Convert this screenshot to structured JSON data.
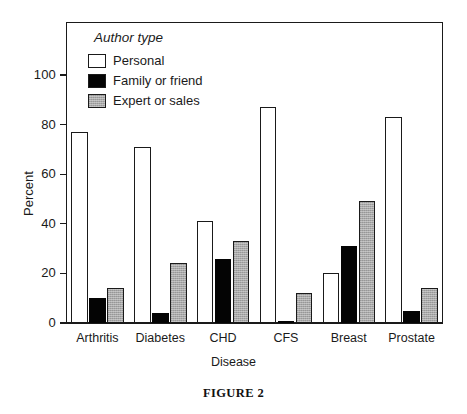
{
  "figure": {
    "caption": "FIGURE 2"
  },
  "legend": {
    "title": "Author type",
    "entries": [
      {
        "label": "Personal",
        "color": "#ffffff",
        "swatch": "open-square"
      },
      {
        "label": "Family or friend",
        "color": "#040404",
        "swatch": "filled-black-square"
      },
      {
        "label": "Expert or sales",
        "color": "#a8a8a8",
        "swatch": "gray-hatched-square"
      }
    ]
  },
  "chart_data": {
    "type": "bar",
    "title": "",
    "xlabel": "Disease",
    "ylabel": "Percent",
    "ylim": [
      0,
      115
    ],
    "yticks": [
      0,
      20,
      40,
      60,
      80,
      100
    ],
    "ytick_labels": [
      "0",
      "20",
      "40",
      "60",
      "80",
      "100"
    ],
    "grid": false,
    "legend_position": "top-left-inside",
    "categories": [
      "Arthritis",
      "Diabetes",
      "CHD",
      "CFS",
      "Breast",
      "Prostate"
    ],
    "series": [
      {
        "name": "Personal",
        "color": "#ffffff",
        "values": [
          77,
          71,
          41,
          87,
          20,
          83
        ]
      },
      {
        "name": "Family or friend",
        "color": "#040404",
        "values": [
          10,
          4,
          26,
          1,
          31,
          5
        ]
      },
      {
        "name": "Expert or sales",
        "color": "#a8a8a8",
        "values": [
          14,
          24,
          33,
          12,
          49,
          14
        ]
      }
    ]
  }
}
